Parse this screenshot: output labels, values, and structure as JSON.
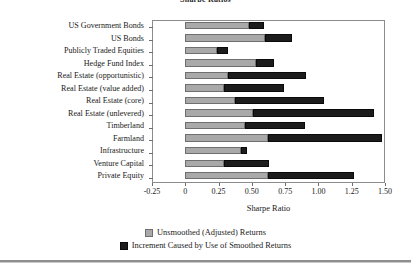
{
  "chart_data": {
    "type": "bar",
    "orientation": "horizontal",
    "stacked": true,
    "title": "Sharpe Ratios",
    "xlabel": "Sharpe Ratio",
    "ylabel": "",
    "xlim": [
      -0.25,
      1.5
    ],
    "xticks": [
      "-0.25",
      "0",
      "0.25",
      "0.50",
      "0.75",
      "1.00",
      "1.25",
      "1.50"
    ],
    "xtick_values": [
      -0.25,
      0,
      0.25,
      0.5,
      0.75,
      1.0,
      1.25,
      1.5
    ],
    "grid": false,
    "legend_position": "bottom",
    "categories": [
      "US Government Bonds",
      "US Bonds",
      "Publicly Traded Equities",
      "Hedge Fund Index",
      "Real Estate (opportunistic)",
      "Real Estate (value added)",
      "Real Estate (core)",
      "Real Estate (unlevered)",
      "Timberland",
      "Farmland",
      "Infrastructure",
      "Venture Capital",
      "Private Equity"
    ],
    "series": [
      {
        "name": "Unsmoothed (Adjusted) Returns",
        "color": "#a9a9a9",
        "values": [
          0.48,
          0.6,
          0.24,
          0.53,
          0.32,
          0.29,
          0.37,
          0.51,
          0.45,
          0.62,
          0.42,
          0.29,
          0.62
        ]
      },
      {
        "name": "Increment Caused by Use of Smoothed Returns",
        "color": "#1c1c1c",
        "values": [
          0.11,
          0.2,
          0.08,
          0.14,
          0.59,
          0.45,
          0.67,
          0.91,
          0.45,
          0.86,
          0.04,
          0.34,
          0.65
        ]
      }
    ],
    "totals": [
      0.59,
      0.8,
      0.32,
      0.67,
      0.91,
      0.74,
      1.04,
      1.42,
      0.9,
      1.48,
      0.46,
      0.63,
      1.27
    ]
  },
  "legend": [
    {
      "label": "Unsmoothed (Adjusted) Returns",
      "swatch": "gray"
    },
    {
      "label": "Increment Caused by Use of Smoothed Returns",
      "swatch": "dark"
    }
  ]
}
